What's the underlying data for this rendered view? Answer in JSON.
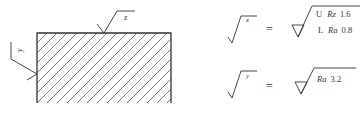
{
  "part": {
    "hatch_color": "#555555",
    "outline_color": "#333333",
    "symbols": [
      {
        "id": "z",
        "label": "z",
        "surface": "top"
      },
      {
        "id": "y",
        "label": "y",
        "surface": "left"
      }
    ]
  },
  "legend": [
    {
      "symbol_label": "z",
      "equals": "=",
      "requirements": [
        {
          "limit": "U",
          "param": "Rz",
          "value": "1.6"
        },
        {
          "limit": "L",
          "param": "Ra",
          "value": "0.8"
        }
      ]
    },
    {
      "symbol_label": "y",
      "equals": "=",
      "requirements": [
        {
          "param": "Ra",
          "value": "3.2"
        }
      ]
    }
  ]
}
